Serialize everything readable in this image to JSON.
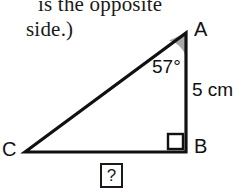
{
  "caption": {
    "line1": "is the opposite",
    "line2": "side.)"
  },
  "diagram": {
    "type": "right-triangle",
    "vertices": {
      "a": "A",
      "b": "B",
      "c": "C"
    },
    "angle_at_a": "57°",
    "side_ab_length": "5 cm",
    "unknown_side_cb": "?",
    "right_angle_at": "B",
    "colors": {
      "stroke": "#111111",
      "angle_fill": "#a8a8a8",
      "background": "#ffffff"
    }
  }
}
